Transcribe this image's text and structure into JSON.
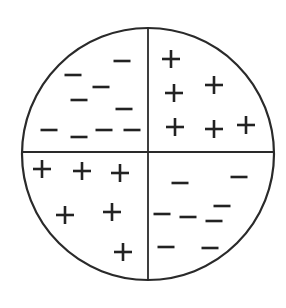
{
  "diagram": {
    "colors": {
      "stroke": "#2a2a2a",
      "symbol": "#222222",
      "background": "#ffffff"
    },
    "circle": {
      "cx": 148,
      "cy": 154,
      "r": 126
    },
    "dividers": {
      "vertical_x": 148,
      "horizontal_y": 152
    },
    "quadrants": [
      {
        "name": "top-left",
        "symbol": "minus",
        "count": 9,
        "positions": [
          [
            122,
            61
          ],
          [
            73,
            75
          ],
          [
            101,
            87
          ],
          [
            79,
            100
          ],
          [
            124,
            109
          ],
          [
            49,
            130
          ],
          [
            79,
            137
          ],
          [
            104,
            130
          ],
          [
            132,
            130
          ]
        ]
      },
      {
        "name": "top-right",
        "symbol": "plus",
        "count": 6,
        "positions": [
          [
            171,
            59
          ],
          [
            214,
            85
          ],
          [
            174,
            93
          ],
          [
            175,
            127
          ],
          [
            214,
            129
          ],
          [
            246,
            125
          ]
        ]
      },
      {
        "name": "bottom-left",
        "symbol": "plus",
        "count": 6,
        "positions": [
          [
            42,
            169
          ],
          [
            82,
            171
          ],
          [
            120,
            173
          ],
          [
            65,
            215
          ],
          [
            112,
            212
          ],
          [
            123,
            252
          ]
        ]
      },
      {
        "name": "bottom-right",
        "symbol": "minus",
        "count": 8,
        "positions": [
          [
            180,
            183
          ],
          [
            239,
            177
          ],
          [
            162,
            214
          ],
          [
            188,
            217
          ],
          [
            222,
            206
          ],
          [
            214,
            221
          ],
          [
            166,
            247
          ],
          [
            210,
            248
          ]
        ]
      }
    ]
  }
}
